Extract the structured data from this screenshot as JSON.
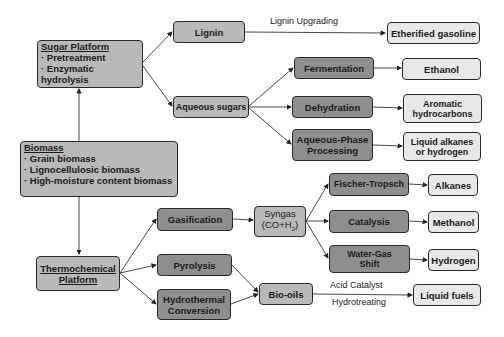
{
  "nodes": {
    "sugar_platform": {
      "title": "Sugar Platform",
      "items": [
        "· Pretreatment",
        "· Enzymatic hydrolysis"
      ]
    },
    "biomass": {
      "title": "Biomass",
      "items": [
        "· Grain biomass",
        "· Lignocellulosic biomass",
        "· High-moisture content biomass"
      ]
    },
    "thermo": {
      "title_line1": "Thermochemical",
      "title_line2": "Platform"
    },
    "lignin": "Lignin",
    "aqueous_sugars": "Aqueous sugars",
    "fermentation": "Fermentation",
    "dehydration": "Dehydration",
    "app_line1": "Aqueous-Phase",
    "app_line2": "Processing",
    "etherified": "Etherified gasoline",
    "ethanol": "Ethanol",
    "aromatic_line1": "Aromatic",
    "aromatic_line2": "hydrocarbons",
    "liquid_alkanes_line1": "Liquid alkanes",
    "liquid_alkanes_line2": "or hydrogen",
    "gasification": "Gasification",
    "pyrolysis": "Pyrolysis",
    "hydrothermal_line1": "Hydrothermal",
    "hydrothermal_line2": "Conversion",
    "syngas_line1": "Syngas",
    "syngas_line2": "(CO+H",
    "syngas_sub": "2",
    "syngas_close": ")",
    "bio_oils": "Bio-oils",
    "fischer": "Fischer-Tropsch",
    "catalysis": "Catalysis",
    "wgs_line1": "Water-Gas",
    "wgs_line2": "Shift",
    "alkanes": "Alkanes",
    "methanol": "Methanol",
    "hydrogen": "Hydrogen",
    "liquid_fuels": "Liquid fuels"
  },
  "edge_labels": {
    "lignin_upgrading": "Lignin Upgrading",
    "acid_catalyst": "Acid Catalyst",
    "hydrotreating": "Hydrotreating"
  },
  "colors": {
    "process_dark": "#8e8e8e",
    "intermediate": "#b9b9b9",
    "product": "#e8e8e8"
  }
}
